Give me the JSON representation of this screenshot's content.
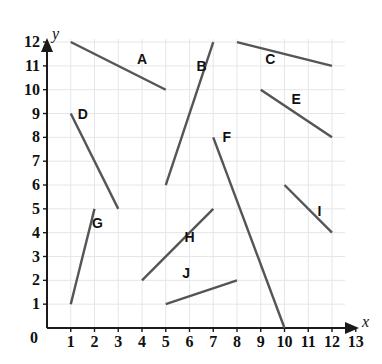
{
  "figure": {
    "kind": "coordinate-grid-line-segments",
    "background_color": "#ffffff",
    "grid_color": "#e3e6ea",
    "axis_color": "#1a1a1a",
    "segment_color": "#555555",
    "label_color": "#111111"
  },
  "axes": {
    "x_name": "y",
    "y_name": "x",
    "x_axis_label": "x",
    "y_axis_label": "y",
    "origin_label": "0",
    "x_ticks": [
      "1",
      "2",
      "3",
      "4",
      "5",
      "6",
      "7",
      "8",
      "9",
      "10",
      "11",
      "12",
      "13"
    ],
    "y_ticks": [
      "1",
      "2",
      "3",
      "4",
      "5",
      "6",
      "7",
      "8",
      "9",
      "10",
      "11",
      "12"
    ],
    "x_min": 0,
    "x_max": 13,
    "y_min": 0,
    "y_max": 12,
    "grid": true
  },
  "chart_data": {
    "type": "scatter",
    "title": "",
    "xlabel": "x",
    "ylabel": "y",
    "xlim": [
      0,
      13
    ],
    "ylim": [
      0,
      12
    ],
    "grid": true,
    "legend": "none",
    "series": [
      {
        "name": "A",
        "label": "A",
        "x1": 1,
        "y1": 12,
        "x2": 5,
        "y2": 10,
        "label_x": 4.0,
        "label_y": 11.3
      },
      {
        "name": "B",
        "label": "B",
        "x1": 5,
        "y1": 6,
        "x2": 7,
        "y2": 12,
        "label_x": 6.5,
        "label_y": 11.0
      },
      {
        "name": "C",
        "label": "C",
        "x1": 8,
        "y1": 12,
        "x2": 12,
        "y2": 11,
        "label_x": 9.4,
        "label_y": 11.3
      },
      {
        "name": "D",
        "label": "D",
        "x1": 1,
        "y1": 9,
        "x2": 3,
        "y2": 5,
        "label_x": 1.5,
        "label_y": 9.0
      },
      {
        "name": "E",
        "label": "E",
        "x1": 9,
        "y1": 10,
        "x2": 12,
        "y2": 8,
        "label_x": 10.5,
        "label_y": 9.6
      },
      {
        "name": "F",
        "label": "F",
        "x1": 7,
        "y1": 8,
        "x2": 10,
        "y2": 0,
        "label_x": 7.6,
        "label_y": 8.0
      },
      {
        "name": "G",
        "label": "G",
        "x1": 1,
        "y1": 1,
        "x2": 2,
        "y2": 5,
        "label_x": 2.1,
        "label_y": 4.4
      },
      {
        "name": "H",
        "label": "H",
        "x1": 4,
        "y1": 2,
        "x2": 7,
        "y2": 5,
        "label_x": 6.0,
        "label_y": 3.8
      },
      {
        "name": "I",
        "label": "I",
        "x1": 10,
        "y1": 6,
        "x2": 12,
        "y2": 4,
        "label_x": 11.6,
        "label_y": 4.9
      },
      {
        "name": "J",
        "label": "J",
        "x1": 5,
        "y1": 1,
        "x2": 8,
        "y2": 2,
        "label_x": 5.9,
        "label_y": 2.3
      }
    ]
  }
}
